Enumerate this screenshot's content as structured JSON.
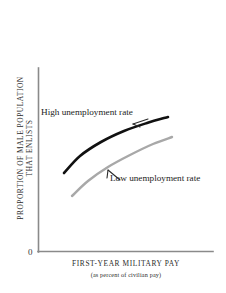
{
  "figure": {
    "name": "enlistment-supply-diagram",
    "background": "#ffffff",
    "origin_label": "0"
  },
  "axes": {
    "color": "#8a8a8a",
    "x_title": "FIRST-YEAR MILITARY PAY",
    "x_subtitle": "(as percent of civilian pay)",
    "y_title_line1": "PROPORTION OF MALE POPULATION",
    "y_title_line2": "THAT ENLISTS"
  },
  "annotations": {
    "high_label": "High unemployment rate",
    "low_label": "Low unemployment rate"
  },
  "chart_data": {
    "type": "line",
    "title": "",
    "subtitle": "",
    "xlabel": "FIRST-YEAR MILITARY PAY (as percent of civilian pay)",
    "ylabel": "PROPORTION OF MALE POPULATION THAT ENLISTS",
    "xlim": [
      0,
      100
    ],
    "ylim": [
      0,
      100
    ],
    "grid": false,
    "axis_ticks": "none",
    "origin_label": "0",
    "legend_position": "inline-annotations",
    "series": [
      {
        "name": "High unemployment rate",
        "color": "#111111",
        "width": 2.6,
        "label_position": "upper-left",
        "points": [
          {
            "x": 21,
            "y": 43
          },
          {
            "x": 30,
            "y": 52
          },
          {
            "x": 42,
            "y": 60
          },
          {
            "x": 55,
            "y": 66
          },
          {
            "x": 68,
            "y": 70
          },
          {
            "x": 80,
            "y": 73
          }
        ],
        "pixel_points": [
          {
            "x": 64,
            "y": 173
          },
          {
            "x": 80,
            "y": 156
          },
          {
            "x": 101,
            "y": 142
          },
          {
            "x": 124,
            "y": 131
          },
          {
            "x": 147,
            "y": 123
          },
          {
            "x": 168,
            "y": 117
          }
        ]
      },
      {
        "name": "Low unemployment rate",
        "color": "#a8a8a8",
        "width": 2.4,
        "label_position": "right",
        "points": [
          {
            "x": 26,
            "y": 30
          },
          {
            "x": 36,
            "y": 38
          },
          {
            "x": 48,
            "y": 46
          },
          {
            "x": 61,
            "y": 52
          },
          {
            "x": 74,
            "y": 57
          },
          {
            "x": 85,
            "y": 59
          }
        ],
        "pixel_points": [
          {
            "x": 72,
            "y": 196
          },
          {
            "x": 88,
            "y": 181
          },
          {
            "x": 108,
            "y": 167
          },
          {
            "x": 130,
            "y": 155
          },
          {
            "x": 153,
            "y": 144
          },
          {
            "x": 172,
            "y": 137
          }
        ]
      }
    ]
  }
}
